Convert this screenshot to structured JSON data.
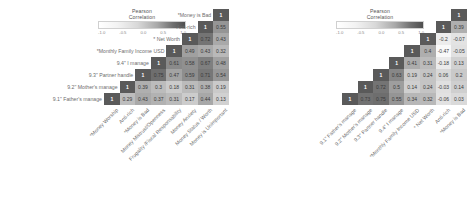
{
  "legend": {
    "title_line1": "Pearson",
    "title_line2": "Correlation",
    "ticks": [
      "-1.0",
      "-0.5",
      "0.0",
      "0.5",
      "1.0"
    ],
    "colors": {
      "low": "#ffffff",
      "high": "#4f4f4f"
    }
  },
  "chart_data": [
    {
      "type": "heatmap",
      "title": "",
      "xlabel": "",
      "ylabel": "",
      "colorbar_label": "Pearson Correlation",
      "vlim": [
        -1.0,
        1.0
      ],
      "grid": false,
      "legend_position": "top-center",
      "triangle": "lower",
      "categories": [
        "*Money Worship",
        "Anti-rich",
        "*Money is Bad",
        "Money Mistrust/Openness",
        "Frugality /Fiscal Responsability",
        "Money Anxiety",
        "Money Status / Worth",
        "Money is Unimportant"
      ],
      "row_labels": [
        "Money is Unimportant",
        "Money Status / Worth",
        "Money Anxiety",
        "Frugality /Fiscal Responsability",
        "Money Mistrust/Openness",
        "*Money is Bad",
        "Anti-rich",
        "*Money Worship"
      ],
      "column_labels": [
        "*Money Worship",
        "Anti-rich",
        "*Money is Bad",
        "Money Mistrust/Openness",
        "Frugality /Fiscal Responsability",
        "Money Anxiety",
        "Money Status / Worth",
        "Money is Unimportant"
      ],
      "rows": [
        {
          "label": "Money is Unimportant",
          "values": [
            1
          ]
        },
        {
          "label": "Money Status / Worth",
          "values": [
            1,
            0.55
          ]
        },
        {
          "label": "Money Anxiety",
          "values": [
            1,
            0.72,
            0.43
          ]
        },
        {
          "label": "Frugality /Fiscal Responsability",
          "values": [
            1,
            0.49,
            0.43,
            0.32
          ]
        },
        {
          "label": "Money Mistrust/Openness",
          "values": [
            1,
            0.61,
            0.58,
            0.67,
            0.48
          ]
        },
        {
          "label": "*Money is Bad",
          "values": [
            1,
            0.75,
            0.47,
            0.59,
            0.71,
            0.54
          ]
        },
        {
          "label": "Anti-rich",
          "values": [
            1,
            0.39,
            0.3,
            0.18,
            0.31,
            0.38,
            0.19
          ]
        },
        {
          "label": "*Money Worship",
          "values": [
            1,
            0.29,
            0.43,
            0.37,
            0.31,
            0.17,
            0.44,
            0.13
          ]
        }
      ]
    },
    {
      "type": "heatmap",
      "title": "",
      "xlabel": "",
      "ylabel": "",
      "colorbar_label": "Pearson Correlation",
      "vlim": [
        -1.0,
        1.0
      ],
      "grid": false,
      "legend_position": "top-center",
      "triangle": "lower",
      "categories": [
        "9.1\" Father's manage",
        "9.2\" Mother's manage",
        "9.3\" Partner handle",
        "9.4\" I manage",
        "*Monthly Family Income USD",
        "* Net Worth",
        "Anti-rich",
        "*Money is Bad"
      ],
      "row_labels": [
        "*Money is Bad",
        "Anti-rich",
        "* Net Worth",
        "*Monthly Family Income USD",
        "9.4\" I manage",
        "9.3\" Partner handle",
        "9.2\" Mother's manage",
        "9.1\" Father's manage"
      ],
      "column_labels": [
        "9.1\" Father's manage",
        "9.2\" Mother's manage",
        "9.3\" Partner handle",
        "9.4\" I manage",
        "*Monthly Family Income USD",
        "* Net Worth",
        "Anti-rich",
        "*Money is Bad"
      ],
      "rows": [
        {
          "label": "*Money is Bad",
          "values": [
            1
          ]
        },
        {
          "label": "Anti-rich",
          "values": [
            1,
            0.39
          ]
        },
        {
          "label": "* Net Worth",
          "values": [
            1,
            -0.2,
            -0.07
          ]
        },
        {
          "label": "*Monthly Family Income USD",
          "values": [
            1,
            0.4,
            -0.47,
            -0.05
          ]
        },
        {
          "label": "9.4\" I manage",
          "values": [
            1,
            0.41,
            0.31,
            -0.18,
            0.13
          ]
        },
        {
          "label": "9.3\" Partner handle",
          "values": [
            1,
            0.63,
            0.19,
            0.24,
            0.06,
            0.2
          ]
        },
        {
          "label": "9.2\" Mother's manage",
          "values": [
            1,
            0.72,
            0.5,
            0.14,
            0.24,
            -0.03,
            0.14
          ]
        },
        {
          "label": "9.1\" Father's manage",
          "values": [
            1,
            0.73,
            0.75,
            0.55,
            0.34,
            0.32,
            -0.06,
            0.03
          ]
        }
      ]
    }
  ]
}
